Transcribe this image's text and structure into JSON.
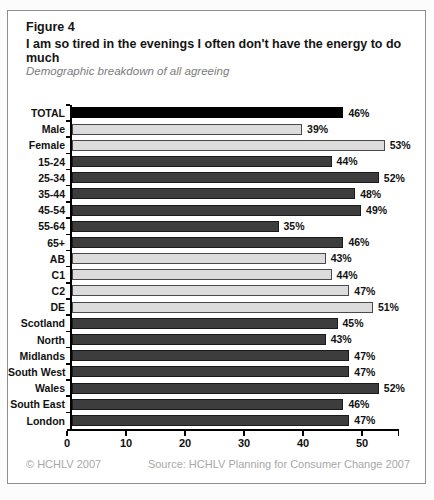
{
  "header": {
    "figure_label": "Figure 4",
    "title": "I am so tired in the evenings I often don't have the energy to do much",
    "subtitle": "Demographic breakdown of all agreeing"
  },
  "chart_data": {
    "type": "bar",
    "orientation": "horizontal",
    "title": "I am so tired in the evenings I often don't have the energy to do much",
    "subtitle": "Demographic breakdown of all agreeing",
    "categories": [
      "TOTAL",
      "Male",
      "Female",
      "15-24",
      "25-34",
      "35-44",
      "45-54",
      "55-64",
      "65+",
      "AB",
      "C1",
      "C2",
      "DE",
      "Scotland",
      "North",
      "Midlands",
      "South West",
      "Wales",
      "South East",
      "London"
    ],
    "values": [
      46,
      39,
      53,
      44,
      52,
      48,
      49,
      35,
      46,
      43,
      44,
      47,
      51,
      45,
      43,
      47,
      47,
      52,
      46,
      47
    ],
    "value_labels": [
      "46%",
      "39%",
      "53%",
      "44%",
      "52%",
      "48%",
      "49%",
      "35%",
      "46%",
      "43%",
      "44%",
      "47%",
      "51%",
      "45%",
      "43%",
      "47%",
      "47%",
      "52%",
      "46%",
      "47%"
    ],
    "groups": [
      "total",
      "gender",
      "gender",
      "age",
      "age",
      "age",
      "age",
      "age",
      "age",
      "class",
      "class",
      "class",
      "class",
      "region",
      "region",
      "region",
      "region",
      "region",
      "region",
      "region"
    ],
    "group_colors": {
      "total": {
        "fill": "#000000",
        "border": "#000000"
      },
      "gender": {
        "fill": "#dcdcdc",
        "border": "#4a4a4a"
      },
      "age": {
        "fill": "#3d3d3d",
        "border": "#1a1a1a"
      },
      "class": {
        "fill": "#dcdcdc",
        "border": "#4a4a4a"
      },
      "region": {
        "fill": "#3d3d3d",
        "border": "#1a1a1a"
      }
    },
    "xticks": [
      0,
      10,
      20,
      30,
      40,
      50
    ],
    "xlim": [
      0,
      56.3
    ],
    "xlabel": "",
    "ylabel": "",
    "grid": false,
    "legend": false
  },
  "footer": {
    "copyright": "© HCHLV 2007",
    "source": "Source: HCHLV Planning for Consumer Change 2007"
  }
}
